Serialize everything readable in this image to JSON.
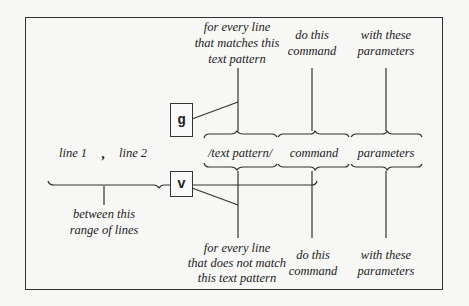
{
  "diagram": {
    "top_labels": {
      "pattern_match": [
        "for every line",
        "that matches this",
        "text pattern"
      ],
      "command": [
        "do this",
        "command"
      ],
      "parameters": [
        "with these",
        "parameters"
      ]
    },
    "middle": {
      "line1": "line 1",
      "comma": ",",
      "line2": "line 2",
      "pattern": "/text pattern/",
      "command": "command",
      "parameters": "parameters"
    },
    "range_label": [
      "between this",
      "range of lines"
    ],
    "boxes": {
      "global": "g",
      "inverse": "v"
    },
    "bottom_labels": {
      "pattern_nomatch": [
        "for every line",
        "that does not match",
        "this text pattern"
      ],
      "command": [
        "do this",
        "command"
      ],
      "parameters": [
        "with these",
        "parameters"
      ]
    }
  }
}
